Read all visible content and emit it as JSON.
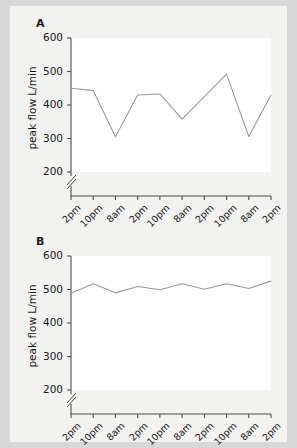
{
  "figure": {
    "background_color": "#f2f2f0",
    "page_background_color": "#d8d8d8",
    "line_color": "#9a9a9a",
    "axis_color": "#4d4d4d",
    "text_color": "#1a1a1a"
  },
  "panels": [
    {
      "letter": "A",
      "ylabel": "peak flow L/min"
    },
    {
      "letter": "B",
      "ylabel": "peak flow L/min"
    }
  ],
  "chart_data": [
    {
      "type": "line",
      "title": "A",
      "xlabel": "",
      "ylabel": "peak flow L/min",
      "ylim": [
        200,
        600
      ],
      "yticks": [
        200,
        300,
        400,
        500,
        600
      ],
      "ytick_labels": [
        "200",
        "300",
        "400",
        "500",
        "600"
      ],
      "axis_break": true,
      "axis_break_below": 200,
      "grid": false,
      "legend": "none",
      "x": [
        1,
        2,
        3,
        4,
        5,
        6,
        7,
        8,
        9,
        10
      ],
      "xtick_labels": [
        "2pm",
        "10pm",
        "8am",
        "2pm",
        "10pm",
        "8am",
        "2pm",
        "10pm",
        "8am",
        "2pm"
      ],
      "values": [
        450,
        443,
        305,
        430,
        433,
        358,
        425,
        492,
        306,
        430
      ],
      "series": [
        {
          "name": "peak flow",
          "values": [
            450,
            443,
            305,
            430,
            433,
            358,
            425,
            492,
            306,
            430
          ]
        }
      ]
    },
    {
      "type": "line",
      "title": "B",
      "xlabel": "",
      "ylabel": "peak flow L/min",
      "ylim": [
        200,
        600
      ],
      "yticks": [
        200,
        300,
        400,
        500,
        600
      ],
      "ytick_labels": [
        "200",
        "300",
        "400",
        "500",
        "600"
      ],
      "axis_break": true,
      "axis_break_below": 200,
      "grid": false,
      "legend": "none",
      "x": [
        1,
        2,
        3,
        4,
        5,
        6,
        7,
        8,
        9,
        10
      ],
      "xtick_labels": [
        "2pm",
        "10pm",
        "8am",
        "2pm",
        "10pm",
        "8am",
        "2pm",
        "10pm",
        "8am",
        "2pm"
      ],
      "values": [
        489,
        517,
        490,
        509,
        499,
        517,
        501,
        517,
        503,
        525
      ],
      "series": [
        {
          "name": "peak flow",
          "values": [
            489,
            517,
            490,
            509,
            499,
            517,
            501,
            517,
            503,
            525
          ]
        }
      ]
    }
  ]
}
